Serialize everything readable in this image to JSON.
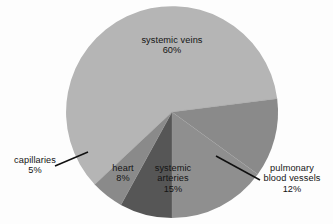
{
  "chart_data": {
    "type": "pie",
    "title": "",
    "subtitle": "",
    "xlabel": "",
    "ylabel": "",
    "legend_position": "none",
    "grid": false,
    "units": "percent",
    "total": 100,
    "categories": [
      "systemic veins",
      "pulmonary blood vessels",
      "systemic arteries",
      "heart",
      "capillaries"
    ],
    "values": [
      60,
      12,
      15,
      8,
      5
    ],
    "slices": [
      {
        "label": "systemic veins",
        "value": 60,
        "value_text": "60%",
        "color": "#b5b5b5",
        "label_placement": "inside",
        "leader_line": false
      },
      {
        "label": "pulmonary blood vessels",
        "value": 12,
        "value_text": "12%",
        "color": "#8a8a8a",
        "label_placement": "outside",
        "leader_line": true
      },
      {
        "label": "systemic arteries",
        "value": 15,
        "value_text": "15%",
        "color": "#8f8f8f",
        "label_placement": "inside",
        "leader_line": false
      },
      {
        "label": "heart",
        "value": 8,
        "value_text": "8%",
        "color": "#565656",
        "label_placement": "inside",
        "leader_line": false
      },
      {
        "label": "capillaries",
        "value": 5,
        "value_text": "5%",
        "color": "#8a8a8a",
        "label_placement": "outside",
        "leader_line": true
      }
    ]
  },
  "chart": {
    "background_color": "#fdfdfd",
    "label_text_color": "#141414",
    "leader_line_color": "#101010",
    "labels": {
      "systemic_veins": {
        "name": "systemic veins",
        "pct": "60%"
      },
      "pulmonary": {
        "name_line1": "pulmonary",
        "name_line2": "blood vessels",
        "pct": "12%"
      },
      "systemic_arteries": {
        "name_line1": "systemic",
        "name_line2": "arteries",
        "pct": "15%"
      },
      "heart": {
        "name": "heart",
        "pct": "8%"
      },
      "capillaries": {
        "name": "capillaries",
        "pct": "5%"
      }
    }
  }
}
